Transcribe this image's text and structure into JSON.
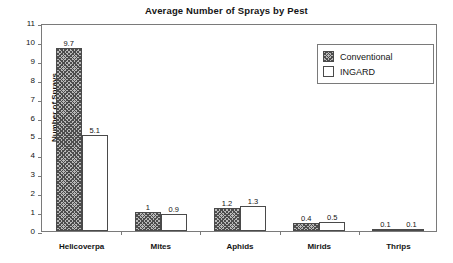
{
  "chart_data": {
    "type": "bar",
    "title": "Average Number of Sprays by Pest",
    "xlabel": "",
    "ylabel": "Number of Sprays",
    "categories": [
      "Helicoverpa",
      "Mites",
      "Aphids",
      "Mirids",
      "Thrips"
    ],
    "series": [
      {
        "name": "Conventional",
        "values": [
          9.7,
          1,
          1.2,
          0.4,
          0.1
        ],
        "labels": [
          "9.7",
          "1",
          "1.2",
          "0.4",
          "0.1"
        ],
        "fill": "crosshatch",
        "color": "#b9b9b9"
      },
      {
        "name": "INGARD",
        "values": [
          5.1,
          0.9,
          1.3,
          0.5,
          0.1
        ],
        "labels": [
          "5.1",
          "0.9",
          "1.3",
          "0.5",
          "0.1"
        ],
        "fill": "solid",
        "color": "#ffffff"
      }
    ],
    "ylim": [
      0,
      11
    ],
    "yticks": [
      0,
      1,
      2,
      3,
      4,
      5,
      6,
      7,
      8,
      9,
      10,
      11
    ],
    "ytick_labels": [
      "0",
      "1",
      "2",
      "3",
      "4",
      "5",
      "6",
      "7",
      "8",
      "9",
      "10",
      "11"
    ],
    "grid": false,
    "show_value_labels": true,
    "legend": {
      "position": "top-right-inside",
      "entries": [
        {
          "label": "Conventional",
          "swatch": "crosshatch"
        },
        {
          "label": "INGARD",
          "swatch": "white"
        }
      ]
    },
    "axis_color": "#7a7a7a",
    "text_color": "#141414"
  }
}
